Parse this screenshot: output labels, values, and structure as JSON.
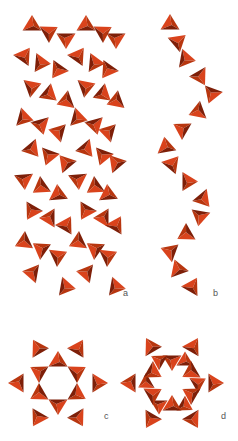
{
  "figure": {
    "colors": {
      "light": "#d9431c",
      "mid": "#b8360f",
      "dark": "#7e1f08"
    },
    "labels": [
      {
        "id": "a",
        "text": "a",
        "x": 123,
        "y": 288
      },
      {
        "id": "b",
        "text": "b",
        "x": 213,
        "y": 288
      },
      {
        "id": "c",
        "text": "c",
        "x": 104,
        "y": 411
      },
      {
        "id": "d",
        "text": "d",
        "x": 221,
        "y": 411
      }
    ],
    "panels": [
      {
        "id": "a",
        "description": "double chains of tetrahedra (side view)"
      },
      {
        "id": "b",
        "description": "single helical chain of tetrahedra (side view)"
      },
      {
        "id": "c",
        "description": "six-membered ring of tetrahedra (top view)"
      },
      {
        "id": "d",
        "description": "twelve-tetrahedra double ring (top view)"
      }
    ]
  }
}
